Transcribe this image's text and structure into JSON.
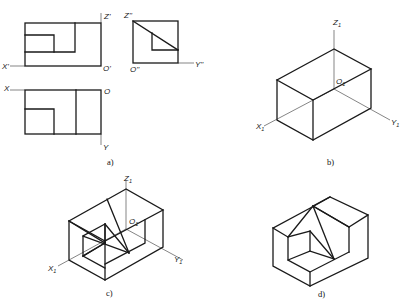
{
  "figure": {
    "panels": [
      {
        "id": "a",
        "caption": "a)",
        "description": "Three orthographic views (front, side, top) with projection axes"
      },
      {
        "id": "b",
        "caption": "b)",
        "description": "Isometric bounding box with axes"
      },
      {
        "id": "c",
        "caption": "c)",
        "description": "Isometric construction with cut lines"
      },
      {
        "id": "d",
        "caption": "d)",
        "description": "Finished isometric solid"
      }
    ],
    "labels": {
      "a_front": {
        "z": "Z'",
        "x": "X'",
        "o": "O'"
      },
      "a_side": {
        "z": "Z''",
        "o": "O''",
        "y": "Y''"
      },
      "a_top": {
        "x": "X",
        "o": "O",
        "y": "Y"
      },
      "b": {
        "z": "Z",
        "o": "O",
        "x": "X",
        "y": "Y",
        "sub": "1"
      },
      "c": {
        "z": "Z",
        "o": "O",
        "x": "X",
        "y": "Y",
        "sub": "1"
      }
    },
    "colors": {
      "line": "#1a1a1a",
      "background": "#ffffff"
    }
  }
}
